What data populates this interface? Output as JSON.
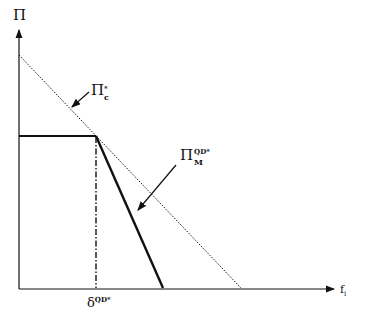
{
  "diagram": {
    "y_axis": {
      "label": "П"
    },
    "x_axis": {
      "label_main": "f",
      "label_sub": "i"
    },
    "curve_c": {
      "main": "П",
      "sup": "*",
      "sub": "c"
    },
    "curve_m": {
      "main": "П",
      "sup": "QD*",
      "sub": "M"
    },
    "delta_mark": {
      "main": "δ",
      "sup": "QD*"
    },
    "colors": {
      "line": "#111111",
      "background": "#ffffff"
    }
  }
}
